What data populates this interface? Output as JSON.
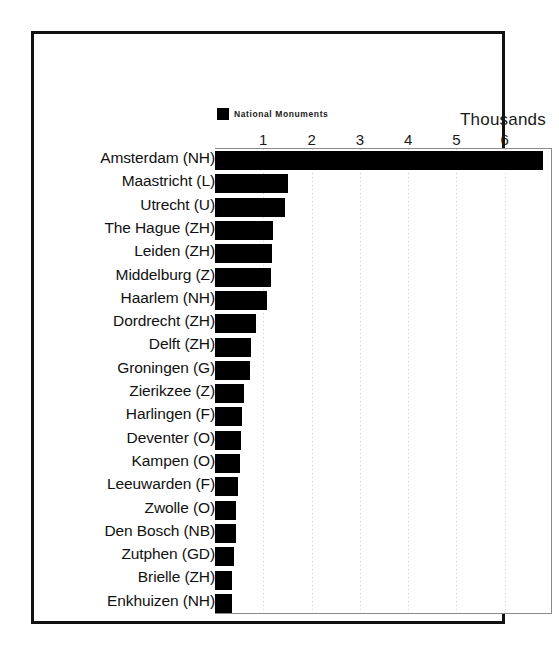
{
  "figure": {
    "unit_caption": "Thousands",
    "legend": {
      "swatch_color": "#000000",
      "series_label": "National Monuments"
    }
  },
  "chart_data": {
    "type": "bar",
    "orientation": "horizontal",
    "title": "",
    "subtitle": "",
    "xlabel": "Thousands",
    "ylabel": "",
    "legend": [
      "National Monuments"
    ],
    "legend_position": "top-left",
    "grid": true,
    "grid_style": "dotted-vertical",
    "xlim": [
      0,
      6.98
    ],
    "units": "thousands",
    "tick_labels": [
      "1",
      "2",
      "3",
      "4",
      "5",
      "6"
    ],
    "tick_values": [
      1,
      2,
      3,
      4,
      5,
      6
    ],
    "categories": [
      "Amsterdam (NH)",
      "Maastricht (L)",
      "Utrecht (U)",
      "The Hague (ZH)",
      "Leiden (ZH)",
      "Middelburg (Z)",
      "Haarlem (NH)",
      "Dordrecht (ZH)",
      "Delft (ZH)",
      "Groningen (G)",
      "Zierikzee (Z)",
      "Harlingen (F)",
      "Deventer (O)",
      "Kampen (O)",
      "Leeuwarden (F)",
      "Zwolle (O)",
      "Den Bosch (NB)",
      "Zutphen (GD)",
      "Brielle (ZH)",
      "Enkhuizen (NH)"
    ],
    "values": [
      6.79,
      1.51,
      1.45,
      1.2,
      1.18,
      1.16,
      1.08,
      0.85,
      0.75,
      0.73,
      0.6,
      0.56,
      0.54,
      0.52,
      0.48,
      0.44,
      0.43,
      0.39,
      0.35,
      0.35
    ],
    "series": [
      {
        "name": "National Monuments",
        "values": [
          6.79,
          1.51,
          1.45,
          1.2,
          1.18,
          1.16,
          1.08,
          0.85,
          0.75,
          0.73,
          0.6,
          0.56,
          0.54,
          0.52,
          0.48,
          0.44,
          0.43,
          0.39,
          0.35,
          0.35
        ]
      }
    ],
    "bar_color": "#000000"
  }
}
